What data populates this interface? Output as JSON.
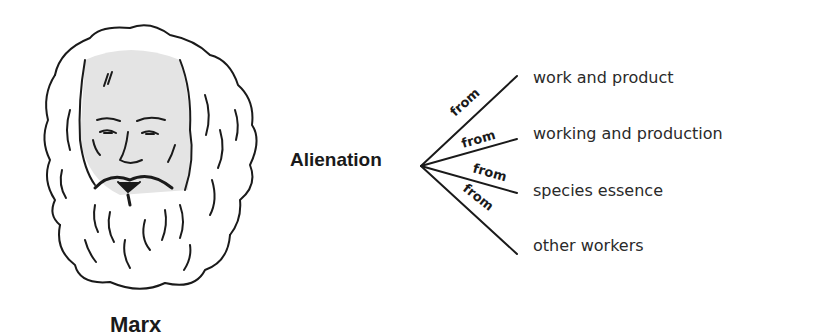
{
  "figure": {
    "portrait": {
      "subject": "Karl Marx line drawing",
      "face_fill": "#e4e4e4",
      "line_color": "#1a1a1a"
    },
    "caption": "Marx",
    "center_concept": "Alienation",
    "connector_label": "from",
    "branches": [
      {
        "connector": "from",
        "target": "work and product"
      },
      {
        "connector": "from",
        "target": "working and production"
      },
      {
        "connector": "from",
        "target": "species essence"
      },
      {
        "connector": "from",
        "target": "other workers"
      }
    ]
  }
}
